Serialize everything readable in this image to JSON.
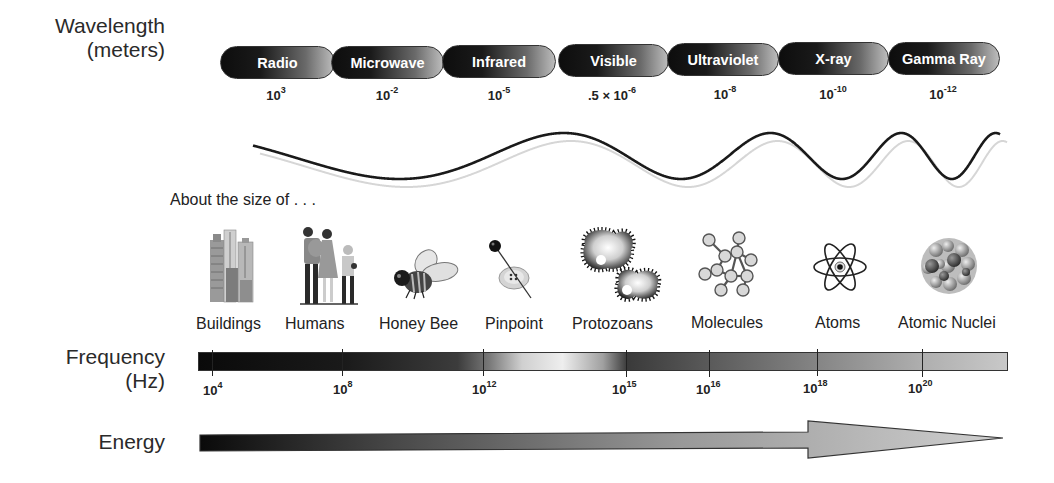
{
  "wavelength": {
    "label_line1": "Wavelength",
    "label_line2": "(meters)",
    "bands": [
      {
        "name": "Radio",
        "value_base": "10",
        "value_exp": "3"
      },
      {
        "name": "Microwave",
        "value_base": "10",
        "value_exp": "-2"
      },
      {
        "name": "Infrared",
        "value_base": "10",
        "value_exp": "-5"
      },
      {
        "name": "Visible",
        "value_base": ".5 × 10",
        "value_exp": "-6"
      },
      {
        "name": "Ultraviolet",
        "value_base": "10",
        "value_exp": "-8"
      },
      {
        "name": "X-ray",
        "value_base": "10",
        "value_exp": "-10"
      },
      {
        "name": "Gamma Ray",
        "value_base": "10",
        "value_exp": "-12"
      }
    ]
  },
  "size": {
    "caption": "About the size of . . .",
    "objects": [
      {
        "label": "Buildings",
        "icon": "buildings-icon"
      },
      {
        "label": "Humans",
        "icon": "humans-icon"
      },
      {
        "label": "Honey Bee",
        "icon": "honey-bee-icon"
      },
      {
        "label": "Pinpoint",
        "icon": "pinpoint-icon"
      },
      {
        "label": "Protozoans",
        "icon": "protozoans-icon"
      },
      {
        "label": "Molecules",
        "icon": "molecules-icon"
      },
      {
        "label": "Atoms",
        "icon": "atom-icon"
      },
      {
        "label": "Atomic Nuclei",
        "icon": "atomic-nuclei-icon"
      }
    ]
  },
  "frequency": {
    "label_line1": "Frequency",
    "label_line2": "(Hz)",
    "ticks": [
      {
        "base": "10",
        "exp": "4"
      },
      {
        "base": "10",
        "exp": "8"
      },
      {
        "base": "10",
        "exp": "12"
      },
      {
        "base": "10",
        "exp": "15"
      },
      {
        "base": "10",
        "exp": "16"
      },
      {
        "base": "10",
        "exp": "18"
      },
      {
        "base": "10",
        "exp": "20"
      }
    ]
  },
  "energy": {
    "label": "Energy"
  },
  "colors": {
    "dark": "#0d0d0d",
    "light": "#c8c8c8",
    "text": "#222222"
  }
}
